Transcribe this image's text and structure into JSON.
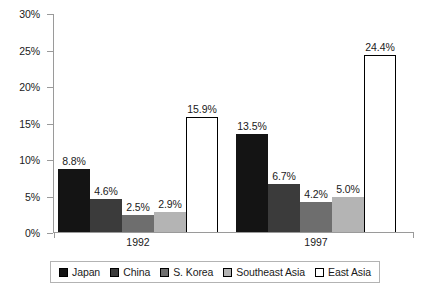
{
  "chart_data": {
    "type": "bar",
    "title": "",
    "subtitle": "",
    "xlabel": "",
    "ylabel": "",
    "categories": [
      "1992",
      "1997"
    ],
    "series": [
      {
        "name": "Japan",
        "color": "#141414",
        "values": [
          8.8,
          13.5
        ],
        "labels": [
          "8.8%",
          "13.5%"
        ]
      },
      {
        "name": "China",
        "color": "#3b3b3b",
        "values": [
          4.6,
          6.7
        ],
        "labels": [
          "4.6%",
          "6.7%"
        ]
      },
      {
        "name": "S. Korea",
        "color": "#6e6e6e",
        "values": [
          2.5,
          4.2
        ],
        "labels": [
          "2.5%",
          "4.2%"
        ]
      },
      {
        "name": "Southeast Asia",
        "color": "#b4b4b4",
        "values": [
          2.9,
          5.0
        ],
        "labels": [
          "2.9%",
          "5.0%"
        ]
      },
      {
        "name": "East Asia",
        "color": "#ffffff",
        "values": [
          15.9,
          24.4
        ],
        "labels": [
          "15.9%",
          "24.4%"
        ]
      }
    ],
    "ylim": [
      0,
      30
    ],
    "ytick_values": [
      0,
      5,
      10,
      15,
      20,
      25,
      30
    ],
    "ytick_labels": [
      "0%",
      "5%",
      "10%",
      "15%",
      "20%",
      "25%",
      "30%"
    ],
    "grid": false,
    "legend_position": "bottom"
  },
  "y_axis": {
    "ticks": [
      {
        "label": "30%"
      },
      {
        "label": "25%"
      },
      {
        "label": "20%"
      },
      {
        "label": "15%"
      },
      {
        "label": "10%"
      },
      {
        "label": "5%"
      },
      {
        "label": "0%"
      }
    ]
  },
  "x_axis": {
    "groups": [
      {
        "label": "1992"
      },
      {
        "label": "1997"
      }
    ]
  },
  "groups": [
    {
      "label": "1992",
      "bars": [
        {
          "series": "Japan",
          "value_label": "8.8%",
          "value": 8.8
        },
        {
          "series": "China",
          "value_label": "4.6%",
          "value": 4.6
        },
        {
          "series": "S. Korea",
          "value_label": "2.5%",
          "value": 2.5
        },
        {
          "series": "Southeast Asia",
          "value_label": "2.9%",
          "value": 2.9
        },
        {
          "series": "East Asia",
          "value_label": "15.9%",
          "value": 15.9
        }
      ]
    },
    {
      "label": "1997",
      "bars": [
        {
          "series": "Japan",
          "value_label": "13.5%",
          "value": 13.5
        },
        {
          "series": "China",
          "value_label": "6.7%",
          "value": 6.7
        },
        {
          "series": "S. Korea",
          "value_label": "4.2%",
          "value": 4.2
        },
        {
          "series": "Southeast Asia",
          "value_label": "5.0%",
          "value": 5.0
        },
        {
          "series": "East Asia",
          "value_label": "24.4%",
          "value": 24.4
        }
      ]
    }
  ],
  "legend": {
    "items": [
      {
        "label": "Japan",
        "color": "#141414"
      },
      {
        "label": "China",
        "color": "#3b3b3b"
      },
      {
        "label": "S. Korea",
        "color": "#6e6e6e"
      },
      {
        "label": "Southeast Asia",
        "color": "#b4b4b4"
      },
      {
        "label": "East Asia",
        "color": "#ffffff"
      }
    ]
  }
}
